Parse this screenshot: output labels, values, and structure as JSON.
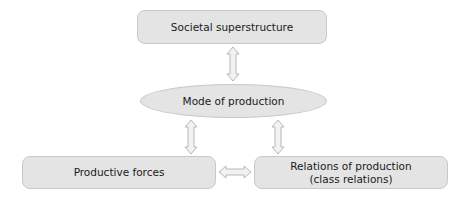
{
  "diagram": {
    "nodes": [
      {
        "id": "societal-superstructure",
        "shape": "rounded-rect",
        "lines": [
          "Societal superstructure"
        ]
      },
      {
        "id": "mode-of-production",
        "shape": "ellipse",
        "lines": [
          "Mode of production"
        ]
      },
      {
        "id": "productive-forces",
        "shape": "rounded-rect",
        "lines": [
          "Productive forces"
        ]
      },
      {
        "id": "relations-of-production",
        "shape": "rounded-rect",
        "lines": [
          "Relations of production",
          "(class relations)"
        ]
      }
    ],
    "edges": [
      {
        "from": "societal-superstructure",
        "to": "mode-of-production",
        "type": "double-arrow",
        "orientation": "vertical"
      },
      {
        "from": "mode-of-production",
        "to": "productive-forces",
        "type": "double-arrow",
        "orientation": "vertical"
      },
      {
        "from": "mode-of-production",
        "to": "relations-of-production",
        "type": "double-arrow",
        "orientation": "vertical"
      },
      {
        "from": "productive-forces",
        "to": "relations-of-production",
        "type": "double-arrow",
        "orientation": "horizontal"
      }
    ],
    "colors": {
      "node_fill": "#e4e4e4",
      "node_border": "#c8c8c8",
      "arrow_fill": "#f2f2f2",
      "arrow_stroke": "#b8b8b8",
      "text": "#1a1a1a"
    }
  }
}
